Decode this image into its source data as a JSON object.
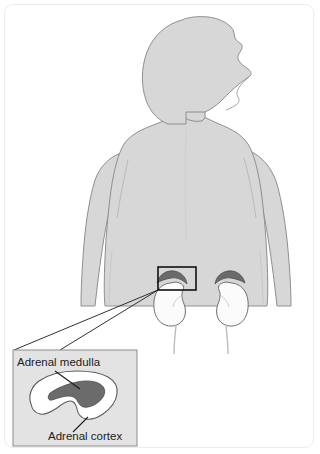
{
  "figure": {
    "view": "posterior view of male torso with magnified inset of adrenal gland"
  },
  "labels": {
    "medulla": "Adrenal medulla",
    "cortex": "Adrenal cortex"
  },
  "colors": {
    "body_fill": "#d7d7d7",
    "body_outline": "#8f8f8f",
    "kidney_fill": "#fbfbfb",
    "kidney_outline": "#6f6f6f",
    "adrenal_dark": "#6b6b6b",
    "inset_bg": "#e3e3e3",
    "inset_border": "#8c8c8c",
    "cortex_fill": "#ffffff",
    "medulla_fill": "#6b6b6b",
    "highlight_box": "#111111",
    "leader_line": "#1b1b1b",
    "frame_border": "#ededed",
    "label_text": "#1b1b1b",
    "page_bg": "#ffffff"
  },
  "parts": {
    "head": "head-profile",
    "neck": "neck",
    "torso": "torso-back",
    "left_arm": "left-arm",
    "right_arm": "right-arm",
    "kidney_left": "left-kidney",
    "kidney_right": "right-kidney",
    "adrenal_left": "left-adrenal-gland",
    "adrenal_right": "right-adrenal-gland",
    "highlight": "highlight-box",
    "connector_upper": "inset-connector-upper",
    "connector_lower": "inset-connector-lower",
    "inset": "magnified-inset",
    "cortex_shape": "adrenal-cortex-shape",
    "medulla_shape": "adrenal-medulla-shape",
    "pointer_medulla": "medulla-pointer-line",
    "pointer_cortex": "cortex-pointer-line"
  }
}
